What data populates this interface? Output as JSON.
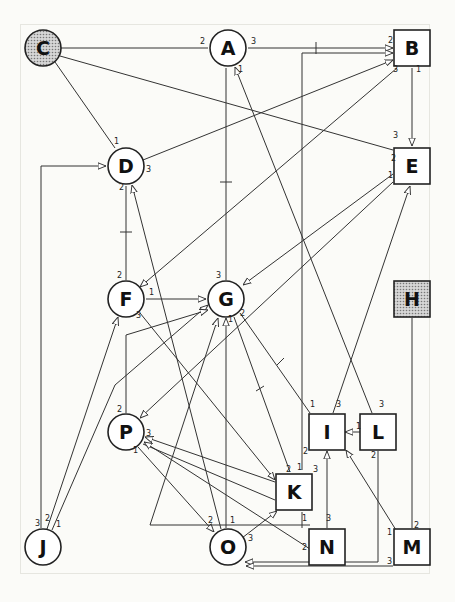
{
  "diagram": {
    "type": "network",
    "colors": {
      "shaded_fill": "#b8b8b8",
      "node_fill": "#ffffff",
      "stroke": "#222222"
    },
    "nodes": [
      {
        "id": "A",
        "shape": "circle",
        "shaded": false,
        "x": 228,
        "y": 48
      },
      {
        "id": "B",
        "shape": "square",
        "shaded": false,
        "x": 412,
        "y": 48
      },
      {
        "id": "C",
        "shape": "circle",
        "shaded": true,
        "x": 43,
        "y": 48
      },
      {
        "id": "D",
        "shape": "circle",
        "shaded": false,
        "x": 126,
        "y": 166
      },
      {
        "id": "E",
        "shape": "square",
        "shaded": false,
        "x": 412,
        "y": 166
      },
      {
        "id": "F",
        "shape": "circle",
        "shaded": false,
        "x": 126,
        "y": 299
      },
      {
        "id": "G",
        "shape": "circle",
        "shaded": false,
        "x": 226,
        "y": 299
      },
      {
        "id": "H",
        "shape": "square",
        "shaded": true,
        "x": 412,
        "y": 299
      },
      {
        "id": "I",
        "shape": "square",
        "shaded": false,
        "x": 327,
        "y": 432
      },
      {
        "id": "L",
        "shape": "square",
        "shaded": false,
        "x": 378,
        "y": 432
      },
      {
        "id": "P",
        "shape": "circle",
        "shaded": false,
        "x": 126,
        "y": 432
      },
      {
        "id": "K",
        "shape": "square",
        "shaded": false,
        "x": 294,
        "y": 492
      },
      {
        "id": "J",
        "shape": "circle",
        "shaded": false,
        "x": 43,
        "y": 547
      },
      {
        "id": "O",
        "shape": "circle",
        "shaded": false,
        "x": 228,
        "y": 547
      },
      {
        "id": "N",
        "shape": "square",
        "shaded": false,
        "x": 327,
        "y": 547
      },
      {
        "id": "M",
        "shape": "square",
        "shaded": false,
        "x": 412,
        "y": 547
      }
    ],
    "edges": [
      {
        "from": "C",
        "to": "A",
        "ports": [
          "",
          "2"
        ]
      },
      {
        "from": "A",
        "to": "B",
        "ports": [
          "3",
          "2"
        ]
      },
      {
        "from": "C",
        "to": "E",
        "ports": [
          "",
          "3"
        ]
      },
      {
        "from": "C",
        "to": "D",
        "ports": [
          "",
          "1"
        ]
      },
      {
        "from": "D",
        "to": "B",
        "ports": [
          "3",
          ""
        ]
      },
      {
        "from": "B",
        "to": "E",
        "ports": [
          "1",
          ""
        ]
      },
      {
        "from": "B",
        "to": "F",
        "ports": [
          "3",
          ""
        ]
      },
      {
        "from": "E",
        "to": "G",
        "ports": [
          "2",
          ""
        ]
      },
      {
        "from": "E",
        "to": "P",
        "ports": [
          "1",
          ""
        ]
      },
      {
        "from": "A",
        "to": "G",
        "ports": [
          "1",
          "3"
        ]
      },
      {
        "from": "F",
        "to": "D",
        "ports": [
          "2",
          "2"
        ]
      },
      {
        "from": "F",
        "to": "G",
        "ports": [
          "1",
          ""
        ]
      },
      {
        "from": "F",
        "to": "K",
        "ports": [
          "3",
          ""
        ]
      },
      {
        "from": "J",
        "to": "D",
        "ports": [
          "3",
          ""
        ]
      },
      {
        "from": "J",
        "to": "F",
        "ports": [
          "2",
          ""
        ]
      },
      {
        "from": "J",
        "to": "G",
        "ports": [
          "1",
          ""
        ]
      },
      {
        "from": "G",
        "to": "I",
        "ports": [
          "2",
          "1"
        ]
      },
      {
        "from": "G",
        "to": "K",
        "ports": [
          "",
          "1"
        ]
      },
      {
        "from": "L",
        "to": "I",
        "ports": [
          "1",
          ""
        ]
      },
      {
        "from": "L",
        "to": "A",
        "ports": [
          "3",
          ""
        ]
      },
      {
        "from": "L",
        "to": "O",
        "ports": [
          "2",
          ""
        ]
      },
      {
        "from": "I",
        "to": "E",
        "ports": [
          "3",
          ""
        ]
      },
      {
        "from": "P",
        "to": "K",
        "ports": [
          "3",
          "2"
        ]
      },
      {
        "from": "P",
        "to": "O",
        "ports": [
          "1",
          "2"
        ]
      },
      {
        "from": "N",
        "to": "P",
        "ports": [
          "2",
          ""
        ]
      },
      {
        "from": "N",
        "to": "I",
        "ports": [
          "3",
          ""
        ]
      },
      {
        "from": "O",
        "to": "K",
        "ports": [
          "3",
          ""
        ]
      },
      {
        "from": "O",
        "to": "G",
        "ports": [
          "1",
          "1"
        ]
      },
      {
        "from": "O",
        "to": "D",
        "ports": [
          "",
          ""
        ]
      },
      {
        "from": "M",
        "to": "I",
        "ports": [
          "1",
          ""
        ]
      },
      {
        "from": "M",
        "to": "O",
        "ports": [
          "3",
          ""
        ]
      },
      {
        "from": "H",
        "to": "M",
        "ports": [
          "",
          "2"
        ]
      },
      {
        "from": "K",
        "to": "B",
        "ports": [
          "2",
          ""
        ]
      },
      {
        "from": "N",
        "to": "G",
        "ports": [
          "1",
          ""
        ]
      }
    ]
  }
}
